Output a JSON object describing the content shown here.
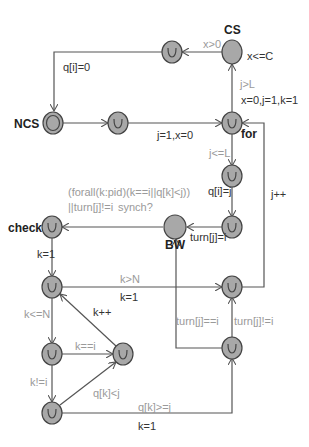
{
  "colors": {
    "node_fill": "#a8a8a8",
    "node_stroke": "#444444",
    "edge": "#555555",
    "guard": "#9a9a9a",
    "update": "#333333"
  },
  "nodes": {
    "cs": {
      "name": "CS",
      "invariant": "x<=C"
    },
    "ncs": {
      "name": "NCS"
    },
    "for": {
      "name": "for"
    },
    "bw": {
      "name": "BW"
    },
    "check": {
      "name": "check"
    }
  },
  "edges": {
    "cs_out_guard": "x>0",
    "top_to_ncs_update": "q[i]=0",
    "u2_to_for_update": "j=1,x=0",
    "for_to_cs_guard": "j>L",
    "for_to_cs_update": "x=0,j=1,k=1",
    "for_to_q_guard": "j<=L",
    "q_update": "q[i]=j",
    "turn_update": "turn[j]=i",
    "jpp_update": "j++",
    "bw_guard_line1": "(forall(k:pid)(k==i||q[k]<j))",
    "bw_guard_line2": "||turn[j]!=i",
    "bw_sync": "synch?",
    "check_update": "k=1",
    "kgtN_guard": "k>N",
    "kgtN_update": "k=1",
    "kleN_guard": "k<=N",
    "kpp_update": "k++",
    "keqi_guard": "k==i",
    "kneqi_guard": "k!=i",
    "qlt_guard": "q[k]<j",
    "qge_guard": "q[k]>=j",
    "qge_update": "k=1",
    "turneq_guard": "turn[j]==i",
    "turnneq_guard": "turn[j]!=i"
  }
}
